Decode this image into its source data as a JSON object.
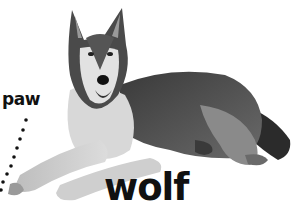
{
  "labels": {
    "paw": "paw",
    "wolf": "wolf"
  },
  "figure": {
    "pointer": "dotted line from 'paw' label down to front paw"
  },
  "colors": {
    "background": "#ffffff",
    "text": "#111111",
    "fur_dark": "#2a2a2a",
    "fur_mid": "#7a7a7a",
    "fur_light": "#e6e6e6"
  }
}
